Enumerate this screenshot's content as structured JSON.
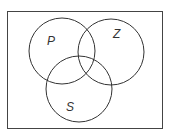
{
  "diagram": {
    "type": "venn",
    "universe": {
      "x": 7,
      "y": 11,
      "width": 155,
      "height": 117
    },
    "sets": [
      {
        "label": "P",
        "cx": 62,
        "cy": 51,
        "r": 33,
        "label_x": 49,
        "label_y": 44
      },
      {
        "label": "Z",
        "cx": 111,
        "cy": 52,
        "r": 33,
        "label_x": 114,
        "label_y": 37
      },
      {
        "label": "S",
        "cx": 79,
        "cy": 89,
        "r": 33,
        "label_x": 67,
        "label_y": 110
      }
    ],
    "stroke_color": "#333333",
    "background": "#ffffff"
  }
}
